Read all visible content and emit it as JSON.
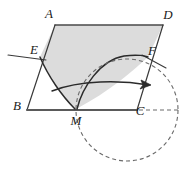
{
  "figure": {
    "canvas": {
      "width": 186,
      "height": 173,
      "background": "#ffffff"
    },
    "style": {
      "stroke_color": "#333333",
      "stroke_color_dark": "#2b2b2b",
      "shade_fill": "#dcdcdc",
      "shade_stroke": "#555555",
      "dash_color": "#666666",
      "base_line_color": "#555555",
      "stroke_width": 1.3,
      "dash_pattern": "4,3"
    },
    "vertices": [
      {
        "name": "A",
        "label": "A",
        "x": 55,
        "y": 25,
        "label_x": 49,
        "label_y": 18
      },
      {
        "name": "D",
        "label": "D",
        "x": 163,
        "y": 25,
        "label_x": 168,
        "label_y": 19
      },
      {
        "name": "E",
        "label": "E",
        "x": 40,
        "y": 57,
        "label_x": 34,
        "label_y": 54
      },
      {
        "name": "F",
        "label": "F",
        "x": 148,
        "y": 57,
        "label_x": 152,
        "label_y": 55
      },
      {
        "name": "B",
        "label": "B",
        "x": 27,
        "y": 110,
        "label_x": 17,
        "label_y": 110
      },
      {
        "name": "C",
        "label": "C",
        "x": 137,
        "y": 110,
        "label_x": 139,
        "label_y": 114
      },
      {
        "name": "M",
        "label": "M",
        "x": 76,
        "y": 110,
        "label_x": 76,
        "label_y": 124
      }
    ],
    "edges": [
      {
        "name": "edge-AD",
        "from": "A",
        "to": "D"
      },
      {
        "name": "edge-AB",
        "from": "A",
        "to": "B"
      },
      {
        "name": "edge-DC",
        "from": "D",
        "to": "C"
      },
      {
        "name": "edge-BC",
        "from": "B",
        "to": "C"
      }
    ],
    "shaded_region": {
      "name": "shaded-region-AEMFD",
      "fill": "#dcdcdc",
      "description": "Region bounded by A-D, D-F, arc F to M, arc M to E, E-A"
    },
    "curves": [
      {
        "name": "cycloid-arc-left",
        "from": "E",
        "to": "M"
      },
      {
        "name": "cycloid-arc-right",
        "from": "M",
        "to": "F"
      },
      {
        "name": "line-through-E",
        "description": "short straight segment extending left of E"
      },
      {
        "name": "line-through-F",
        "description": "short straight segment extending right of F"
      }
    ],
    "rolling_circle": {
      "name": "rolling-circle",
      "cx": 127,
      "cy": 110,
      "r": 51,
      "dashed": true
    },
    "direction_arrow": {
      "name": "direction-arrow",
      "description": "curved arrow pointing right, indicating rolling direction",
      "from_x": 52,
      "from_y": 89,
      "to_x": 150,
      "to_y": 84
    },
    "tangent_dashes": {
      "name": "tangent-dash-line",
      "description": "dashed horizontal line from C rightwards to circle edge",
      "from_x": 139,
      "to_x": 180,
      "y": 110
    }
  }
}
